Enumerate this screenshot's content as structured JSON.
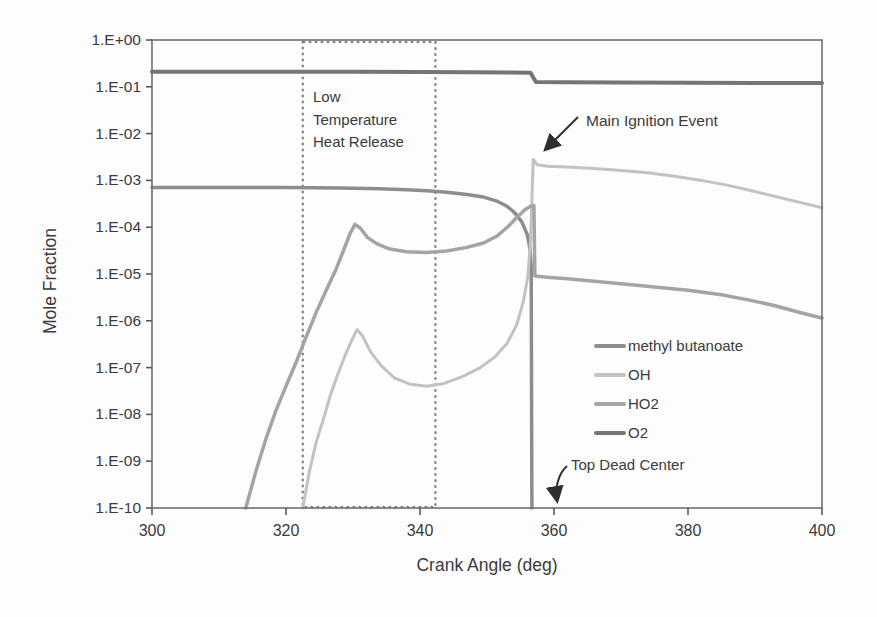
{
  "figure": {
    "background": "#fdfdfd",
    "frame_color": "#6e6e6e",
    "tick_color": "#5a5a5a",
    "text_color": "#3b3b3b",
    "box_color": "#7d7d7d",
    "arrow_color": "#2f2f2f"
  },
  "chart_data": {
    "type": "line",
    "title": "",
    "xlabel": "Crank Angle (deg)",
    "ylabel": "Mole Fraction",
    "x_axis": {
      "min": 300,
      "max": 400,
      "tick_values": [
        300,
        320,
        340,
        360,
        380,
        400
      ],
      "tick_labels": [
        "300",
        "320",
        "340",
        "360",
        "380",
        "400"
      ]
    },
    "y_axis": {
      "scale": "log",
      "min_exp": -10,
      "max_exp": 0,
      "tick_labels": [
        "1.E+00",
        "1.E-01",
        "1.E-02",
        "1.E-03",
        "1.E-04",
        "1.E-05",
        "1.E-06",
        "1.E-07",
        "1.E-08",
        "1.E-09",
        "1.E-10"
      ]
    },
    "grid": false,
    "legend_position": "inside-lower-right",
    "series": [
      {
        "name": "methyl butanoate",
        "color": "#8d8d8d",
        "width": 3.5,
        "points": [
          [
            300,
            0.0007
          ],
          [
            310,
            0.0007
          ],
          [
            320,
            0.0007
          ],
          [
            328,
            0.00069
          ],
          [
            334,
            0.00066
          ],
          [
            338,
            0.00063
          ],
          [
            341,
            0.0006
          ],
          [
            344,
            0.00056
          ],
          [
            347,
            0.0005
          ],
          [
            349.5,
            0.00044
          ],
          [
            351.5,
            0.00036
          ],
          [
            353,
            0.00028
          ],
          [
            354.2,
            0.0002
          ],
          [
            355.2,
            0.00013
          ],
          [
            356,
            7e-05
          ],
          [
            356.4,
            3.5e-05
          ],
          [
            356.6,
            1.5e-05
          ],
          [
            356.7,
            1e-10
          ]
        ]
      },
      {
        "name": "OH",
        "color": "#c2c2c2",
        "width": 3,
        "points": [
          [
            322.5,
            1e-10
          ],
          [
            323.5,
            6e-10
          ],
          [
            324.5,
            2.5e-09
          ],
          [
            325.6,
            8e-09
          ],
          [
            326.6,
            2.5e-08
          ],
          [
            327.7,
            7e-08
          ],
          [
            328.8,
            1.8e-07
          ],
          [
            329.8,
            3.8e-07
          ],
          [
            330.6,
            6.5e-07
          ],
          [
            331.4,
            4.8e-07
          ],
          [
            332.6,
            2.2e-07
          ],
          [
            334.2,
            1.1e-07
          ],
          [
            336.2,
            6e-08
          ],
          [
            338.6,
            4.4e-08
          ],
          [
            341,
            4e-08
          ],
          [
            343.6,
            4.6e-08
          ],
          [
            346.4,
            6.5e-08
          ],
          [
            349,
            1e-07
          ],
          [
            351.2,
            1.7e-07
          ],
          [
            353,
            3.3e-07
          ],
          [
            354.4,
            8e-07
          ],
          [
            355.4,
            2.5e-06
          ],
          [
            356.1,
            9e-06
          ],
          [
            356.5,
            5e-05
          ],
          [
            356.75,
            0.0006
          ],
          [
            356.9,
            0.0028
          ],
          [
            357.5,
            0.00215
          ],
          [
            359,
            0.002
          ],
          [
            362,
            0.00193
          ],
          [
            366,
            0.0018
          ],
          [
            370,
            0.00163
          ],
          [
            374,
            0.00145
          ],
          [
            378,
            0.00123
          ],
          [
            382,
            0.001
          ],
          [
            386,
            0.00078
          ],
          [
            390,
            0.00058
          ],
          [
            394,
            0.00042
          ],
          [
            397,
            0.00033
          ],
          [
            400,
            0.00026
          ]
        ]
      },
      {
        "name": "HO2",
        "color": "#a4a4a4",
        "width": 3.5,
        "points": [
          [
            314,
            1e-10
          ],
          [
            315.5,
            6e-10
          ],
          [
            317,
            3e-09
          ],
          [
            318.5,
            1.2e-08
          ],
          [
            320,
            4e-08
          ],
          [
            321.5,
            1.3e-07
          ],
          [
            323,
            4.5e-07
          ],
          [
            324.5,
            1.5e-06
          ],
          [
            326,
            4.5e-06
          ],
          [
            327.5,
            1.3e-05
          ],
          [
            328.7,
            3.5e-05
          ],
          [
            329.6,
            7.5e-05
          ],
          [
            330.3,
            0.000115
          ],
          [
            331.1,
            9.5e-05
          ],
          [
            332.2,
            6e-05
          ],
          [
            333.6,
            4.4e-05
          ],
          [
            335.5,
            3.4e-05
          ],
          [
            338,
            3e-05
          ],
          [
            341,
            2.9e-05
          ],
          [
            344,
            3.1e-05
          ],
          [
            347,
            3.7e-05
          ],
          [
            349.5,
            4.6e-05
          ],
          [
            351.5,
            6.5e-05
          ],
          [
            353.2,
            0.000105
          ],
          [
            354.6,
            0.00017
          ],
          [
            355.7,
            0.00024
          ],
          [
            356.6,
            0.000285
          ],
          [
            357.0,
            0.00029
          ],
          [
            357.15,
            9e-06
          ],
          [
            359,
            8.5e-06
          ],
          [
            362,
            7.9e-06
          ],
          [
            366,
            7e-06
          ],
          [
            370,
            6.2e-06
          ],
          [
            375,
            5.3e-06
          ],
          [
            380,
            4.5e-06
          ],
          [
            385,
            3.6e-06
          ],
          [
            389,
            2.8e-06
          ],
          [
            393,
            2.1e-06
          ],
          [
            396,
            1.6e-06
          ],
          [
            398,
            1.35e-06
          ],
          [
            400,
            1.15e-06
          ]
        ]
      },
      {
        "name": "O2",
        "color": "#757575",
        "width": 4,
        "points": [
          [
            300,
            0.21
          ],
          [
            315,
            0.21
          ],
          [
            330,
            0.209
          ],
          [
            340,
            0.207
          ],
          [
            348,
            0.205
          ],
          [
            353,
            0.203
          ],
          [
            356.5,
            0.2
          ],
          [
            357.3,
            0.126
          ],
          [
            362,
            0.125
          ],
          [
            370,
            0.124
          ],
          [
            380,
            0.122
          ],
          [
            390,
            0.121
          ],
          [
            400,
            0.12
          ]
        ]
      }
    ],
    "annotations": {
      "low_temp_box": {
        "label": "Low\nTemperature\nHeat Release",
        "x_start": 322.5,
        "x_end": 342.3
      },
      "main_ignition": {
        "label": "Main Ignition Event",
        "x": 357
      },
      "top_dead_center": {
        "label": "Top Dead Center",
        "x": 360
      }
    }
  }
}
